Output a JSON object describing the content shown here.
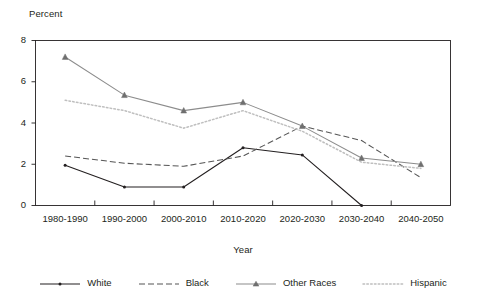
{
  "chart_data": {
    "type": "line",
    "title": "",
    "xlabel": "Year",
    "ylabel": "Percent",
    "categories": [
      "1980-1990",
      "1990-2000",
      "2000-2010",
      "2010-2020",
      "2020-2030",
      "2030-2040",
      "2040-2050"
    ],
    "ylim": [
      0,
      8
    ],
    "yticks": [
      0,
      2,
      4,
      6,
      8
    ],
    "ytick_labels": [
      "0",
      "2",
      "4",
      "6",
      "8"
    ],
    "grid": false,
    "legend_position": "bottom",
    "series": [
      {
        "name": "White",
        "style": "solid",
        "color": "#231f20",
        "marker": "dot",
        "values": [
          1.95,
          0.9,
          0.9,
          2.8,
          2.45,
          0.0,
          null
        ]
      },
      {
        "name": "Black",
        "style": "dashed",
        "color": "#555555",
        "marker": "none",
        "values": [
          2.4,
          2.05,
          1.9,
          2.4,
          3.85,
          3.15,
          1.35
        ]
      },
      {
        "name": "Other Races",
        "style": "solid",
        "color": "#8c8c8c",
        "marker": "triangle",
        "values": [
          7.2,
          5.35,
          4.6,
          5.0,
          3.85,
          2.3,
          2.0
        ]
      },
      {
        "name": "Hispanic",
        "style": "dotted",
        "color": "#bfbfbf",
        "marker": "none",
        "values": [
          5.1,
          4.6,
          3.75,
          4.6,
          3.6,
          2.1,
          1.8
        ]
      }
    ]
  },
  "axis": {
    "y_title": "Percent",
    "x_title": "Year"
  },
  "legend": {
    "items": [
      {
        "label": "White"
      },
      {
        "label": "Black"
      },
      {
        "label": "Other Races"
      },
      {
        "label": "Hispanic"
      }
    ]
  },
  "colors": {
    "axis": "#231f20",
    "white_series": "#231f20",
    "black_series": "#555555",
    "other_races_series": "#8c8c8c",
    "hispanic_series": "#bfbfbf",
    "background": "#ffffff"
  }
}
